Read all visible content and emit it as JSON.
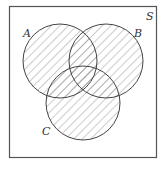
{
  "diagram": {
    "type": "venn",
    "universe_label": "S",
    "sets": [
      {
        "label": "A",
        "cx": 60,
        "cy": 61,
        "r": 37
      },
      {
        "label": "B",
        "cx": 106,
        "cy": 61,
        "r": 37
      },
      {
        "label": "C",
        "cx": 83,
        "cy": 103,
        "r": 37
      }
    ],
    "shaded_region": "A ∪ B ∪ C",
    "colors": {
      "stroke": "#444444",
      "hatch": "#9a9a9a",
      "background": "#ffffff"
    }
  }
}
